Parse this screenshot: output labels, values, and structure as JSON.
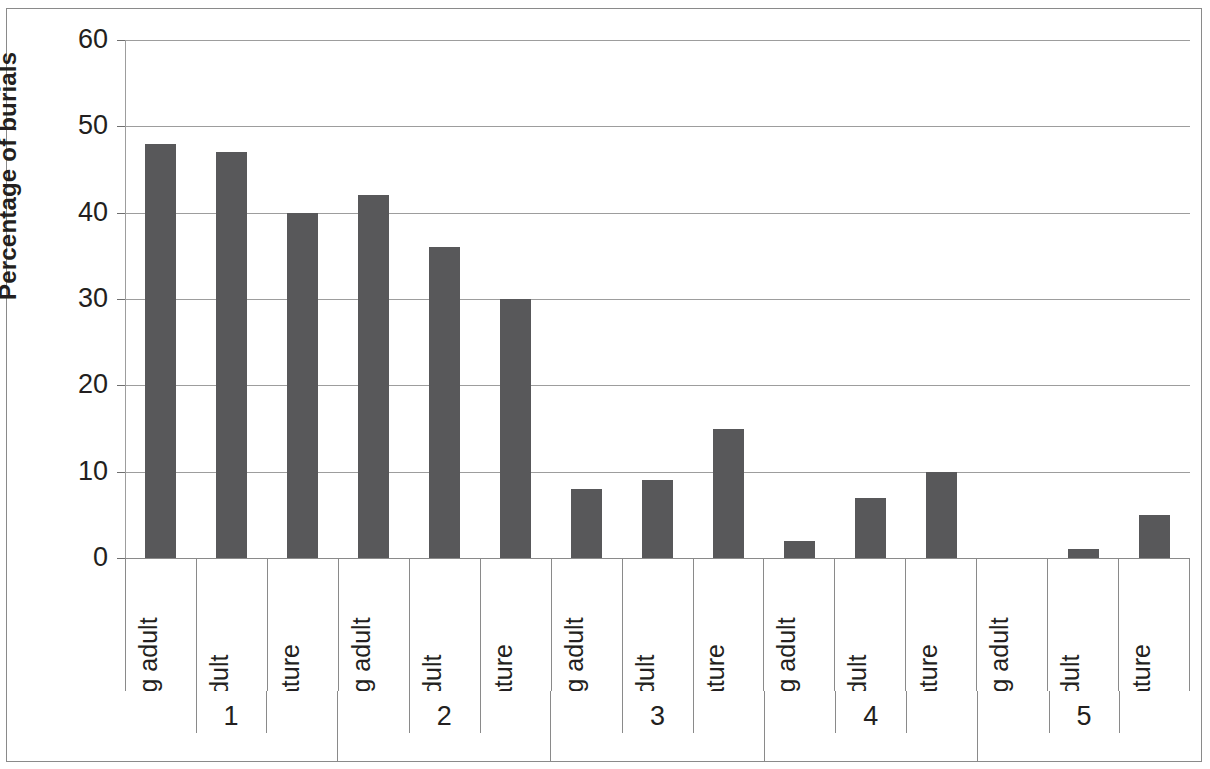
{
  "chart_data": {
    "type": "bar",
    "title": "",
    "xlabel": "",
    "ylabel": "Percentage of burials",
    "ylim": [
      0,
      60
    ],
    "ytick_step": 10,
    "yticks": [
      0,
      10,
      20,
      30,
      40,
      50,
      60
    ],
    "grid": "horizontal",
    "legend": "none",
    "bar_color": "#58585a",
    "grid_color": "#9d9d9d",
    "text_color": "#231f20",
    "group_label_name": "",
    "categories": [
      "Young adult",
      "Adult",
      "Mature"
    ],
    "groups": [
      "1",
      "2",
      "3",
      "4",
      "5"
    ],
    "series": [
      {
        "name": "Young adult",
        "values": [
          48,
          47,
          40
        ]
      },
      {
        "name": "Adult",
        "values": [
          42,
          36,
          30
        ]
      },
      {
        "name": "Mature",
        "values": [
          8,
          9,
          15
        ]
      },
      {
        "name": "Young adult 4",
        "values": [
          2,
          7,
          10
        ]
      },
      {
        "name": "Adult 5",
        "values": [
          0,
          1,
          5
        ]
      }
    ],
    "bars": [
      {
        "group": "1",
        "category": "Young adult",
        "value": 48
      },
      {
        "group": "1",
        "category": "Adult",
        "value": 47
      },
      {
        "group": "1",
        "category": "Mature",
        "value": 40
      },
      {
        "group": "2",
        "category": "Young adult",
        "value": 42
      },
      {
        "group": "2",
        "category": "Adult",
        "value": 36
      },
      {
        "group": "2",
        "category": "Mature",
        "value": 30
      },
      {
        "group": "3",
        "category": "Young adult",
        "value": 8
      },
      {
        "group": "3",
        "category": "Adult",
        "value": 9
      },
      {
        "group": "3",
        "category": "Mature",
        "value": 15
      },
      {
        "group": "4",
        "category": "Young adult",
        "value": 2
      },
      {
        "group": "4",
        "category": "Adult",
        "value": 7
      },
      {
        "group": "4",
        "category": "Mature",
        "value": 10
      },
      {
        "group": "5",
        "category": "Young adult",
        "value": 0
      },
      {
        "group": "5",
        "category": "Adult",
        "value": 1
      },
      {
        "group": "5",
        "category": "Mature",
        "value": 5
      }
    ]
  },
  "axis": {
    "y_title": "Percentage of burials",
    "y_labels": [
      "60",
      "50",
      "40",
      "30",
      "20",
      "10",
      "0"
    ]
  },
  "category_labels": [
    "Young adult",
    "Adult",
    "Mature",
    "Young adult",
    "Adult",
    "Mature",
    "Young adult",
    "Adult",
    "Mature",
    "Young adult",
    "Adult",
    "Mature",
    "Young adult",
    "Adult",
    "Mature"
  ],
  "group_labels": [
    "1",
    "2",
    "3",
    "4",
    "5"
  ]
}
